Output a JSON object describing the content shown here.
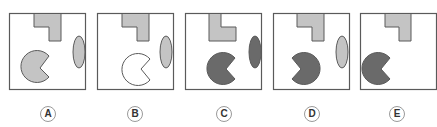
{
  "colors": {
    "border": "#5a5a5a",
    "light_fill": "#c4c4c4",
    "dark_fill": "#6a6a6a",
    "white_fill": "#ffffff",
    "label_ring": "#9a9a9a"
  },
  "options": [
    {
      "label": "A",
      "pacman_fill": "light",
      "pacman_mouth": "right",
      "l_shape": "standard",
      "ellipse": "light"
    },
    {
      "label": "B",
      "pacman_fill": "white",
      "pacman_mouth": "right",
      "l_shape": "standard",
      "ellipse": "light"
    },
    {
      "label": "C",
      "pacman_fill": "dark",
      "pacman_mouth": "right",
      "l_shape": "mirrored",
      "ellipse": "dark"
    },
    {
      "label": "D",
      "pacman_fill": "dark",
      "pacman_mouth": "left",
      "l_shape": "standard",
      "ellipse": "light"
    },
    {
      "label": "E",
      "pacman_fill": "dark",
      "pacman_mouth": "right",
      "l_shape": "standard",
      "ellipse": "none"
    }
  ]
}
